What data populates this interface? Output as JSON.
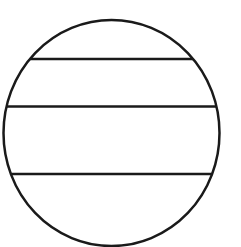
{
  "diagram": {
    "stroke_color": "#1a1a1a",
    "background_color": "#ffffff",
    "stroke_width": 2.5,
    "circle": {
      "cx": 111.5,
      "cy": 133,
      "rx": 108,
      "ry": 113
    },
    "chords": [
      {
        "y": 59
      },
      {
        "y": 106.5
      },
      {
        "y": 174
      }
    ]
  }
}
